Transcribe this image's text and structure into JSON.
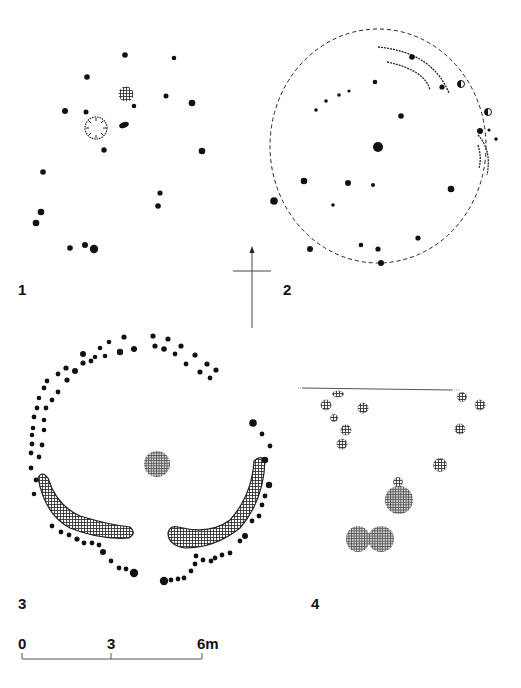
{
  "figure": {
    "panels": [
      {
        "id": "1",
        "label": "1"
      },
      {
        "id": "2",
        "label": "2"
      },
      {
        "id": "3",
        "label": "3"
      },
      {
        "id": "4",
        "label": "4"
      }
    ],
    "north_arrow": {
      "direction": "up"
    },
    "scale_bar": {
      "ticks": [
        "0",
        "3",
        "6m"
      ]
    }
  }
}
